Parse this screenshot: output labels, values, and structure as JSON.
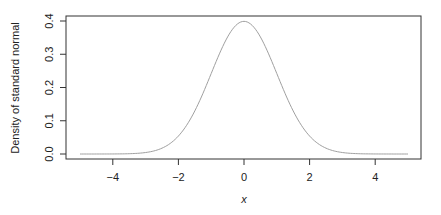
{
  "chart_data": {
    "type": "line",
    "title": "",
    "xlabel": "x",
    "ylabel": "Density of standard normal",
    "xlim": [
      -5,
      5
    ],
    "ylim": [
      0,
      0.4
    ],
    "x_ticks": [
      -4,
      -2,
      0,
      2,
      4
    ],
    "y_ticks": [
      0.0,
      0.1,
      0.2,
      0.3,
      0.4
    ],
    "y_tick_labels": [
      "0.0",
      "0.1",
      "0.2",
      "0.3",
      "0.4"
    ],
    "x_tick_labels": [
      "−4",
      "−2",
      "0",
      "2",
      "4"
    ],
    "grid": false,
    "legend": null,
    "series": [
      {
        "name": "dnorm(x)",
        "color": "#a0a0a0",
        "function": "standard normal density",
        "x": [
          -5,
          -4,
          -3,
          -2.5,
          -2,
          -1.5,
          -1,
          -0.5,
          0,
          0.5,
          1,
          1.5,
          2,
          2.5,
          3,
          4,
          5
        ],
        "values": [
          1.5e-06,
          0.000134,
          0.00443,
          0.0175,
          0.054,
          0.1295,
          0.242,
          0.3521,
          0.3989,
          0.3521,
          0.242,
          0.1295,
          0.054,
          0.0175,
          0.00443,
          0.000134,
          1.5e-06
        ]
      }
    ]
  },
  "colors": {
    "axis": "#333333",
    "curve": "#a0a0a0",
    "background": "#ffffff"
  }
}
